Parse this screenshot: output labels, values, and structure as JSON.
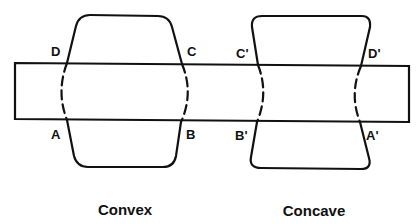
{
  "diagram": {
    "type": "lens shapes intersecting a band",
    "line_color": "#111111",
    "background": "#ffffff",
    "convex": {
      "caption": "Convex",
      "labels": {
        "top_left": "D",
        "top_right": "C",
        "bottom_left": "A",
        "bottom_right": "B"
      }
    },
    "concave": {
      "caption": "Concave",
      "labels": {
        "top_left": "C'",
        "top_right": "D'",
        "bottom_left": "B'",
        "bottom_right": "A'"
      }
    }
  }
}
